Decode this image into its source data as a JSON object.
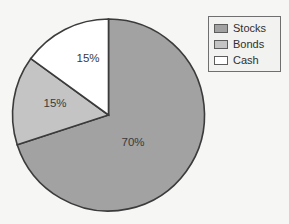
{
  "chart_data": {
    "type": "pie",
    "title": "",
    "labels": [
      "Stocks",
      "Bonds",
      "Cash"
    ],
    "values": [
      70,
      15,
      15
    ],
    "value_labels": [
      "70%",
      "15%",
      "15%"
    ],
    "colors": [
      "#a2a2a2",
      "#c4c4c4",
      "#ffffff"
    ],
    "legend_position": "top-right",
    "grid": false,
    "start_angle_deg": 0,
    "direction": "clockwise",
    "outline_color": "#3b3b3b",
    "background_color": "#f6f6f4",
    "label_color": "#3a3a3a",
    "slices": [
      {
        "name": "Stocks",
        "value": 70,
        "value_label": "70%",
        "color": "#a2a2a2",
        "label_x": 133,
        "label_y": 146
      },
      {
        "name": "Bonds",
        "value": 15,
        "value_label": "15%",
        "color": "#c4c4c4",
        "label_x": 55,
        "label_y": 107
      },
      {
        "name": "Cash",
        "value": 15,
        "value_label": "15%",
        "color": "#ffffff",
        "label_x": 88,
        "label_y": 62
      }
    ]
  },
  "legend": {
    "items": [
      {
        "label": "Stocks",
        "color": "#a2a2a2"
      },
      {
        "label": "Bonds",
        "color": "#c4c4c4"
      },
      {
        "label": "Cash",
        "color": "#ffffff"
      }
    ]
  }
}
